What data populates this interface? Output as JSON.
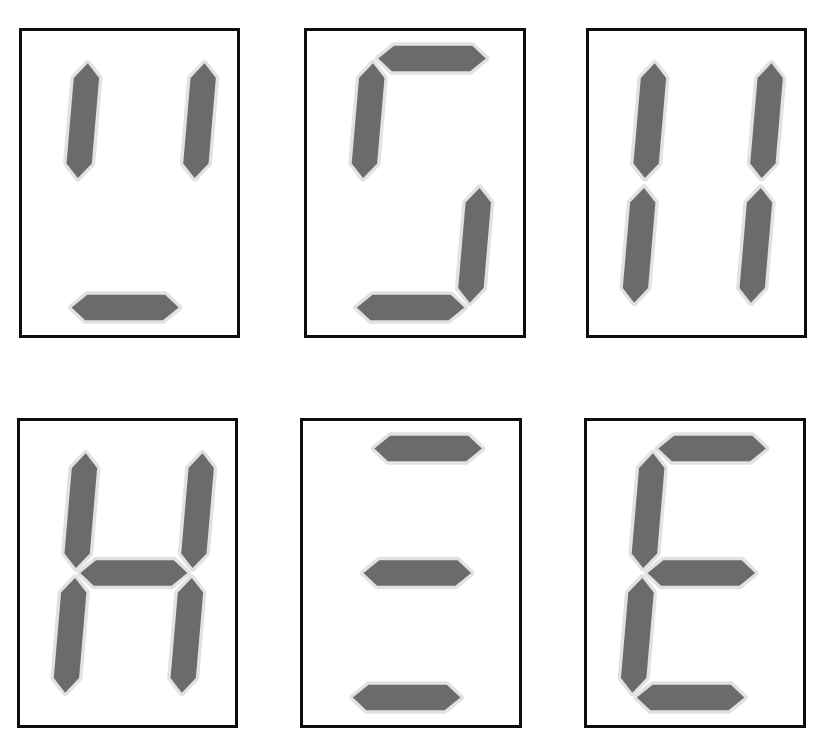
{
  "figure": {
    "background_color": "#ffffff",
    "grid": {
      "rows": 2,
      "columns": 3,
      "panel_count": 6
    },
    "style": {
      "frame_color": "#0d0d0d",
      "frame_width_px": 3,
      "segment_fill_color": "#6b6b6b",
      "segment_halo_color": "#e2e2e2",
      "panel_background": "#ffffff",
      "segment_shape": "slanted-hexagon",
      "italic_slant_px": 22
    },
    "segment_names": {
      "a": "top",
      "b": "top-right",
      "c": "bottom-right",
      "d": "bottom",
      "e": "bottom-left",
      "f": "top-left",
      "g": "middle"
    }
  },
  "panels": [
    {
      "index": 1,
      "position": {
        "row": 1,
        "column": 1
      },
      "name": "panel-1",
      "lit_segments": [
        "f",
        "b",
        "d"
      ],
      "unlit_segments": [
        "a",
        "g",
        "e",
        "c"
      ],
      "lit_count": 3,
      "resembles": "u-open-top",
      "segments": {
        "a": false,
        "b": true,
        "c": false,
        "d": true,
        "e": false,
        "f": true,
        "g": false
      }
    },
    {
      "index": 2,
      "position": {
        "row": 1,
        "column": 2
      },
      "name": "panel-2",
      "lit_segments": [
        "a",
        "f",
        "c",
        "d"
      ],
      "unlit_segments": [
        "b",
        "g",
        "e"
      ],
      "lit_count": 4,
      "resembles": "S-without-middle",
      "segments": {
        "a": true,
        "b": false,
        "c": true,
        "d": true,
        "e": false,
        "f": true,
        "g": false
      }
    },
    {
      "index": 3,
      "position": {
        "row": 1,
        "column": 3
      },
      "name": "panel-3",
      "lit_segments": [
        "f",
        "b",
        "e",
        "c"
      ],
      "unlit_segments": [
        "a",
        "g",
        "d"
      ],
      "lit_count": 4,
      "resembles": "11",
      "segments": {
        "a": false,
        "b": true,
        "c": true,
        "d": false,
        "e": true,
        "f": true,
        "g": false
      }
    },
    {
      "index": 4,
      "position": {
        "row": 2,
        "column": 1
      },
      "name": "panel-4",
      "lit_segments": [
        "f",
        "b",
        "g",
        "e",
        "c"
      ],
      "unlit_segments": [
        "a",
        "d"
      ],
      "lit_count": 5,
      "resembles": "H",
      "segments": {
        "a": false,
        "b": true,
        "c": true,
        "d": false,
        "e": true,
        "f": true,
        "g": true
      }
    },
    {
      "index": 5,
      "position": {
        "row": 2,
        "column": 2
      },
      "name": "panel-5",
      "lit_segments": [
        "a",
        "g",
        "d"
      ],
      "unlit_segments": [
        "b",
        "c",
        "e",
        "f"
      ],
      "lit_count": 3,
      "resembles": "triple-bar",
      "segments": {
        "a": true,
        "b": false,
        "c": false,
        "d": true,
        "e": false,
        "f": false,
        "g": true
      }
    },
    {
      "index": 6,
      "position": {
        "row": 2,
        "column": 3
      },
      "name": "panel-6",
      "lit_segments": [
        "a",
        "f",
        "g",
        "e",
        "d"
      ],
      "unlit_segments": [
        "b",
        "c"
      ],
      "lit_count": 5,
      "resembles": "E",
      "segments": {
        "a": true,
        "b": false,
        "c": false,
        "d": true,
        "e": true,
        "f": true,
        "g": true
      }
    }
  ]
}
